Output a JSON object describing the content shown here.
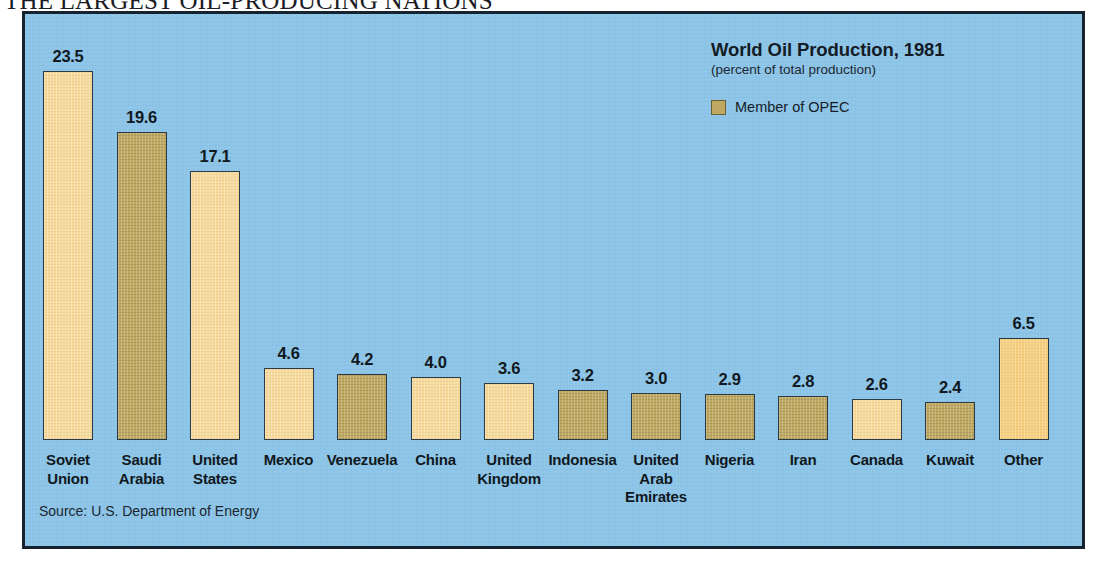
{
  "headline": "THE LARGEST OIL-PRODUCING NATIONS",
  "legend": {
    "title": "World Oil Production, 1981",
    "subtitle": "(percent of total production)",
    "key_label": "Member of OPEC",
    "swatch_color": "#BFA962"
  },
  "source": "Source: U.S. Department of Energy",
  "colors": {
    "panel_background": "#8DC5E8",
    "panel_border": "#16232F",
    "bar_light": "#F6D99A",
    "bar_gold": "#F6CF7E",
    "bar_opec": "#BFA962",
    "bar_outline": "#2C3A46",
    "text": "#101820"
  },
  "chart_data": {
    "type": "bar",
    "title": "World Oil Production, 1981",
    "subtitle": "(percent of total production)",
    "xlabel": "",
    "ylabel": "percent of total production",
    "ylim": [
      0,
      23.5
    ],
    "grid": false,
    "legend_position": "top-right",
    "legend_entries": [
      "Member of OPEC"
    ],
    "source": "Source: U.S. Department of Energy",
    "categories": [
      "Soviet Union",
      "Saudi Arabia",
      "United States",
      "Mexico",
      "Venezuela",
      "China",
      "United Kingdom",
      "Indonesia",
      "United Arab Emirates",
      "Nigeria",
      "Iran",
      "Canada",
      "Kuwait",
      "Other"
    ],
    "values": [
      23.5,
      19.6,
      17.1,
      4.6,
      4.2,
      4.0,
      3.6,
      3.2,
      3.0,
      2.9,
      2.8,
      2.6,
      2.4,
      6.5
    ],
    "opec_member": [
      false,
      true,
      false,
      false,
      true,
      false,
      false,
      true,
      true,
      true,
      true,
      false,
      true,
      false
    ]
  },
  "bars": [
    {
      "label_line1": "Soviet",
      "label_line2": "Union",
      "value": "23.5",
      "style": "light"
    },
    {
      "label_line1": "Saudi",
      "label_line2": "Arabia",
      "value": "19.6",
      "style": "opec"
    },
    {
      "label_line1": "United",
      "label_line2": "States",
      "value": "17.1",
      "style": "light"
    },
    {
      "label_line1": "Mexico",
      "label_line2": "",
      "value": "4.6",
      "style": "light"
    },
    {
      "label_line1": "Venezuela",
      "label_line2": "",
      "value": "4.2",
      "style": "opec"
    },
    {
      "label_line1": "China",
      "label_line2": "",
      "value": "4.0",
      "style": "light"
    },
    {
      "label_line1": "United",
      "label_line2": "Kingdom",
      "value": "3.6",
      "style": "light"
    },
    {
      "label_line1": "Indonesia",
      "label_line2": "",
      "value": "3.2",
      "style": "opec"
    },
    {
      "label_line1": "United",
      "label_line2": "Arab",
      "label_line3": "Emirates",
      "value": "3.0",
      "style": "opec"
    },
    {
      "label_line1": "Nigeria",
      "label_line2": "",
      "value": "2.9",
      "style": "opec"
    },
    {
      "label_line1": "Iran",
      "label_line2": "",
      "value": "2.8",
      "style": "opec"
    },
    {
      "label_line1": "Canada",
      "label_line2": "",
      "value": "2.6",
      "style": "light"
    },
    {
      "label_line1": "Kuwait",
      "label_line2": "",
      "value": "2.4",
      "style": "opec"
    },
    {
      "label_line1": "Other",
      "label_line2": "",
      "value": "6.5",
      "style": "gold"
    }
  ]
}
